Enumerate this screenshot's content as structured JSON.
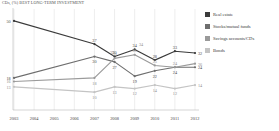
{
  "title": "CDs, (%) BEST LONG-TERM INVESTMENT",
  "legend": {
    "position": "right",
    "items": [
      {
        "label": "Real estate",
        "color": "#3b3b3b"
      },
      {
        "label": "Stocks/mutual funds",
        "color": "#6e6e6e"
      },
      {
        "label": "Savings accounts/CDs",
        "color": "#9a9a9a"
      },
      {
        "label": "Bonds",
        "color": "#c4c4c4"
      }
    ]
  },
  "chart_data": {
    "type": "line",
    "title": "CDs, (%) BEST LONG-TERM INVESTMENT",
    "xlabel": "",
    "ylabel": "",
    "ylim": [
      0,
      55
    ],
    "grid": true,
    "legend_position": "right",
    "categories": [
      "2003",
      "2004",
      "2005",
      "2006",
      "2007",
      "2008",
      "2009",
      "2010",
      "2011",
      "2012"
    ],
    "series": [
      {
        "name": "Real estate",
        "color": "#3b3b3b",
        "values": [
          50,
          null,
          null,
          null,
          37,
          30,
          34,
          28,
          33,
          32
        ],
        "labels": [
          "50",
          "",
          "",
          "",
          "37",
          "30",
          "34",
          "28",
          "33",
          "32"
        ]
      },
      {
        "name": "Stocks/mutual funds",
        "color": "#6e6e6e",
        "values": [
          18,
          null,
          null,
          null,
          30,
          27,
          19,
          22,
          24,
          24
        ],
        "labels": [
          "18",
          "",
          "",
          "",
          "30",
          "27",
          "19",
          "22",
          "24",
          "24"
        ]
      },
      {
        "name": "Savings accounts/CDs",
        "color": "#9a9a9a",
        "values": [
          16,
          null,
          null,
          null,
          18,
          29,
          31,
          25,
          24,
          26
        ],
        "labels": [
          "16",
          "",
          "",
          "",
          "18",
          "29",
          "31",
          "25",
          "24",
          "26"
        ]
      },
      {
        "name": "Bonds",
        "color": "#c4c4c4",
        "values": [
          13,
          null,
          null,
          null,
          10,
          13,
          12,
          14,
          12,
          14
        ],
        "labels": [
          "13",
          "",
          "",
          "",
          "10",
          "13",
          "12",
          "14",
          "12",
          "14"
        ]
      }
    ],
    "extra_labels": [
      {
        "text": "29",
        "x": 112,
        "y": 52
      },
      {
        "text": "34",
        "x": 141,
        "y": 44
      }
    ]
  }
}
